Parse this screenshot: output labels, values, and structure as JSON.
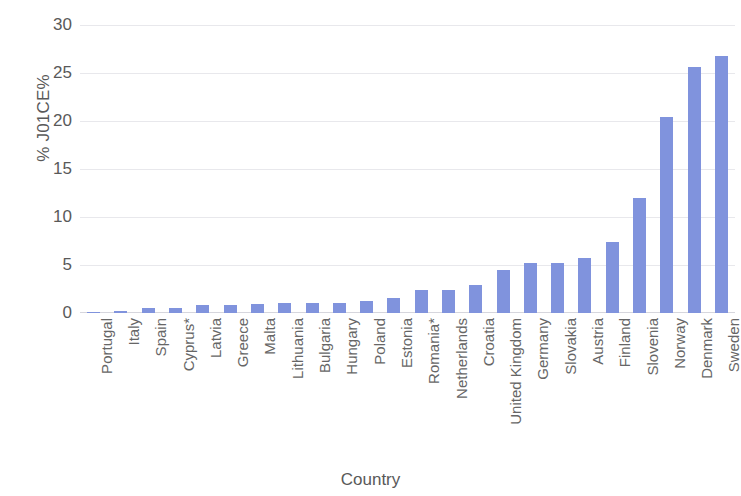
{
  "chart_data": {
    "type": "bar",
    "title": "",
    "xlabel": "Country",
    "ylabel": "% J01CE%",
    "ylim": [
      0,
      30
    ],
    "yticks": [
      0,
      5,
      10,
      15,
      20,
      25,
      30
    ],
    "grid": true,
    "legend": "none",
    "bar_color": "#8093dd",
    "categories": [
      "Portugal",
      "Italy",
      "Spain",
      "Cyprus*",
      "Latvia",
      "Greece",
      "Malta",
      "Lithuania",
      "Bulgaria",
      "Hungary",
      "Poland",
      "Estonia",
      "Romania*",
      "Netherlands",
      "Croatia",
      "United Kingdom",
      "Germany",
      "Slovakia",
      "Austria",
      "Finland",
      "Slovenia",
      "Norway",
      "Denmark",
      "Sweden"
    ],
    "values": [
      0.15,
      0.2,
      0.5,
      0.55,
      0.8,
      0.85,
      0.95,
      1.0,
      1.0,
      1.05,
      1.3,
      1.6,
      2.4,
      2.4,
      2.9,
      4.5,
      5.2,
      5.2,
      5.7,
      7.4,
      12.0,
      20.4,
      25.6,
      26.8
    ]
  }
}
